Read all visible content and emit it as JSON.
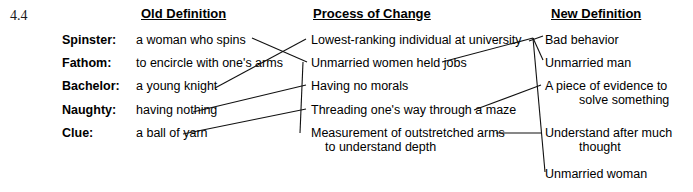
{
  "figure": {
    "number": "4.4"
  },
  "columns": {
    "old": "Old Definition",
    "process": "Process of Change",
    "new": "New Definition"
  },
  "rows": [
    {
      "term": "Spinster:",
      "old_definition": "a woman who spins"
    },
    {
      "term": "Fathom:",
      "old_definition": "to encircle with one's arms"
    },
    {
      "term": "Bachelor:",
      "old_definition": "a young knight"
    },
    {
      "term": "Naughty:",
      "old_definition": "having nothing"
    },
    {
      "term": "Clue:",
      "old_definition": "a ball of yarn"
    }
  ],
  "process_of_change": [
    {
      "line1": "Lowest-ranking individual at university",
      "line2": ""
    },
    {
      "line1": "Unmarried women held jobs",
      "line2": ""
    },
    {
      "line1": "Having no morals",
      "line2": ""
    },
    {
      "line1": "Threading one's way through a maze",
      "line2": ""
    },
    {
      "line1": "Measurement of outstretched arms",
      "line2": "to understand depth"
    }
  ],
  "new_definitions": [
    {
      "line1": "Bad behavior",
      "line2": ""
    },
    {
      "line1": "Unmarried man",
      "line2": ""
    },
    {
      "line1": "A piece of evidence to",
      "line2": "solve something"
    },
    {
      "line1": "Understand after much",
      "line2": "thought"
    },
    {
      "line1": "Unmarried woman",
      "line2": ""
    }
  ],
  "connections": {
    "old_to_process": [
      {
        "from": "a woman who spins",
        "to": "Unmarried women held jobs"
      },
      {
        "from": "to encircle with one's arms",
        "to": "Measurement of outstretched arms to understand depth"
      },
      {
        "from": "a young knight",
        "to": "Lowest-ranking individual at university"
      },
      {
        "from": "having nothing",
        "to": "Having no morals"
      },
      {
        "from": "a ball of yarn",
        "to": "Threading one's way through a maze"
      }
    ],
    "process_to_new": [
      {
        "from": "Lowest-ranking individual at university",
        "to": "Bad behavior"
      },
      {
        "from": "Unmarried women held jobs",
        "to": "Unmarried man"
      },
      {
        "from": "Having no morals",
        "to": "Unmarried woman"
      },
      {
        "from": "Threading one's way through a maze",
        "to": "A piece of evidence to solve something"
      },
      {
        "from": "Measurement of outstretched arms to understand depth",
        "to": "Understand after much thought"
      }
    ]
  },
  "colors": {
    "ink": "#111111",
    "background": "#ffffff"
  }
}
